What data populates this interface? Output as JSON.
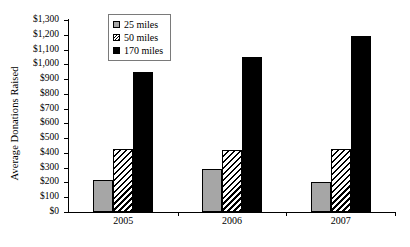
{
  "chart_data": {
    "type": "bar",
    "title": "",
    "subtitle": "",
    "xlabel": "",
    "ylabel": "Average Donations Raised",
    "categories": [
      "2005",
      "2006",
      "2007"
    ],
    "series": [
      {
        "name": "25 miles",
        "values": [
          215,
          290,
          200
        ],
        "swatch": "gray-solid",
        "color": "#a6a6a6"
      },
      {
        "name": "50 miles",
        "values": [
          430,
          420,
          430
        ],
        "swatch": "diagonal-hatch",
        "color": "#000000"
      },
      {
        "name": "170 miles",
        "values": [
          950,
          1050,
          1190
        ],
        "swatch": "black-solid",
        "color": "#000000"
      }
    ],
    "ylim": [
      0,
      1300
    ],
    "ytick_step": 100,
    "ytick_labels": [
      "$0",
      "$100",
      "$200",
      "$300",
      "$400",
      "$500",
      "$600",
      "$700",
      "$800",
      "$900",
      "$1,000",
      "$1,100",
      "$1,200",
      "$1,300"
    ],
    "ytick_values": [
      0,
      100,
      200,
      300,
      400,
      500,
      600,
      700,
      800,
      900,
      1000,
      1100,
      1200,
      1300
    ],
    "grid": false,
    "legend_position": "top-left-inside",
    "axis_color": "#000000",
    "background": "#ffffff"
  }
}
